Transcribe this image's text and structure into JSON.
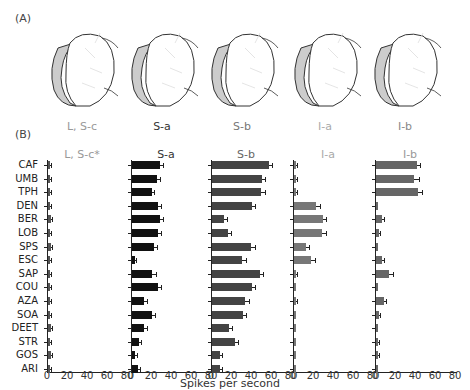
{
  "panels": {
    "A_label": "(A)",
    "B_label": "(B)"
  },
  "sensilla_labels": [
    {
      "text": "L, S-c",
      "color": "#999999"
    },
    {
      "text": "S-a",
      "color": "#333333"
    },
    {
      "text": "S-b",
      "color": "#777777"
    },
    {
      "text": "I-a",
      "color": "#aaaaaa"
    },
    {
      "text": "I-b",
      "color": "#888888"
    }
  ],
  "xlabel": "Spikes per second",
  "chart_data": {
    "type": "bar",
    "orientation": "horizontal",
    "title": "",
    "xlabel": "Spikes per second",
    "ylabel": "",
    "xlim": [
      0,
      80
    ],
    "xticks": [
      "0",
      "20",
      "40",
      "60",
      "80"
    ],
    "grid": false,
    "categories": [
      "CAF",
      "UMB",
      "TPH",
      "DEN",
      "BER",
      "LOB",
      "SPS",
      "ESC",
      "SAP",
      "COU",
      "AZA",
      "SOA",
      "DEET",
      "STR",
      "GOS",
      "ARI"
    ],
    "series": [
      {
        "name": "L, S-c*",
        "color": "#555555",
        "title_color": "#999999",
        "values": [
          2,
          2,
          1,
          2,
          3,
          1,
          3,
          1,
          2,
          2,
          2,
          2,
          3,
          2,
          3,
          2
        ],
        "errors": [
          1,
          1,
          1,
          1,
          1,
          1,
          1,
          1,
          1,
          1,
          1,
          1,
          1,
          1,
          1,
          1
        ]
      },
      {
        "name": "S-a",
        "color": "#111111",
        "title_color": "#333333",
        "values": [
          28,
          25,
          20,
          26,
          28,
          26,
          22,
          3,
          20,
          26,
          12,
          20,
          12,
          7,
          3,
          6
        ],
        "errors": [
          3,
          3,
          2,
          3,
          3,
          3,
          3,
          1,
          4,
          3,
          3,
          3,
          3,
          2,
          2,
          2
        ]
      },
      {
        "name": "S-b",
        "color": "#444444",
        "title_color": "#666666",
        "values": [
          57,
          50,
          49,
          40,
          12,
          16,
          39,
          30,
          48,
          40,
          33,
          31,
          17,
          23,
          8,
          8
        ],
        "errors": [
          3,
          3,
          4,
          3,
          3,
          3,
          4,
          4,
          3,
          3,
          4,
          3,
          3,
          3,
          2,
          2
        ]
      },
      {
        "name": "I-a",
        "color": "#777777",
        "title_color": "#aaaaaa",
        "values": [
          2,
          2,
          2,
          22,
          29,
          28,
          12,
          17,
          2,
          0,
          1,
          0,
          0,
          0,
          0,
          0
        ],
        "errors": [
          1,
          1,
          1,
          4,
          3,
          4,
          3,
          4,
          1,
          0,
          1,
          0,
          0,
          0,
          0,
          0
        ]
      },
      {
        "name": "I-b",
        "color": "#666666",
        "title_color": "#999999",
        "values": [
          41,
          38,
          42,
          0,
          6,
          3,
          0,
          6,
          13,
          0,
          8,
          3,
          0,
          1,
          1,
          0
        ],
        "errors": [
          3,
          5,
          4,
          0,
          2,
          1,
          0,
          2,
          4,
          0,
          2,
          1,
          0,
          1,
          1,
          0
        ]
      }
    ]
  }
}
